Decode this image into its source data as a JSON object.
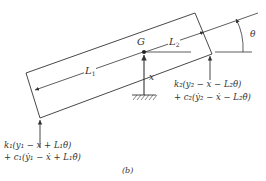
{
  "diagram": {
    "caption": "(b)",
    "labels": {
      "G": "G",
      "L1": "L",
      "L1_sub": "1",
      "L2": "L",
      "L2_sub": "2",
      "x": "x",
      "theta": "θ"
    },
    "forces": {
      "left": {
        "line1": "k₁(y₁ − x + L₁θ)",
        "line2": "+ c₁(ẏ₁ − ẋ + L₁θ̇)"
      },
      "right": {
        "line1": "k₂(y₂ − x − L₂θ)",
        "line2": "+ c₂(ẏ₂ − ẋ − L₂θ̇)"
      }
    },
    "colors": {
      "stroke": "#333333",
      "background": "#ffffff"
    }
  }
}
